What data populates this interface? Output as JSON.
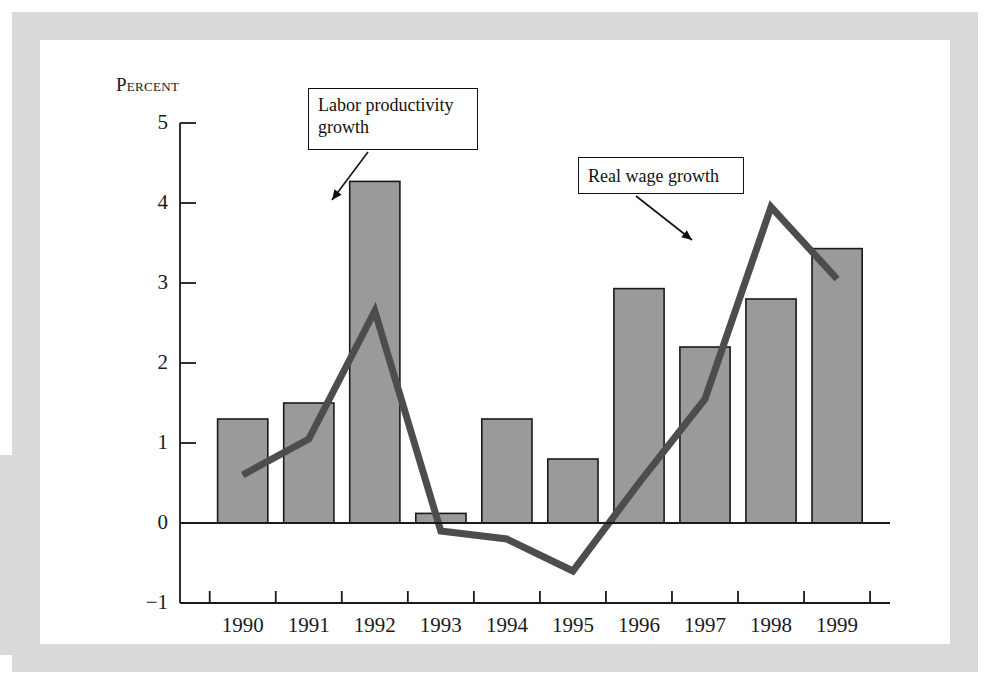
{
  "figure": {
    "y_axis_title": "Percent",
    "callout_productivity": "Labor productivity growth",
    "callout_wage": "Real wage growth"
  },
  "colors": {
    "bar_fill": "#9a9a9a",
    "bar_stroke": "#1a1a1a",
    "line": "#4d4d4d",
    "axis": "#1a1a1a",
    "frame": "#d9d9d9",
    "page": "#ffffff"
  },
  "chart_data": {
    "type": "bar",
    "title": "",
    "subtitle": "",
    "xlabel": "",
    "ylabel": "Percent",
    "categories": [
      "1990",
      "1991",
      "1992",
      "1993",
      "1994",
      "1995",
      "1996",
      "1997",
      "1998",
      "1999"
    ],
    "ylim": [
      -1,
      5
    ],
    "yticks": [
      -1,
      0,
      1,
      2,
      3,
      4,
      5
    ],
    "ytick_labels": [
      "−1",
      "0",
      "1",
      "2",
      "3",
      "4",
      "5"
    ],
    "grid": false,
    "legend": "annotated callouts",
    "series": [
      {
        "name": "Labor productivity growth",
        "type": "bar",
        "values": [
          1.3,
          1.5,
          4.27,
          0.12,
          1.3,
          0.8,
          2.93,
          2.2,
          2.8,
          3.43
        ]
      },
      {
        "name": "Real wage growth",
        "type": "line",
        "values": [
          0.6,
          1.05,
          2.65,
          -0.1,
          -0.2,
          -0.6,
          0.5,
          1.55,
          3.95,
          3.05
        ]
      }
    ],
    "annotations": [
      {
        "text": "Labor productivity growth",
        "points_to": "1992 bar"
      },
      {
        "text": "Real wage growth",
        "points_to": "1998 line peak"
      }
    ]
  }
}
